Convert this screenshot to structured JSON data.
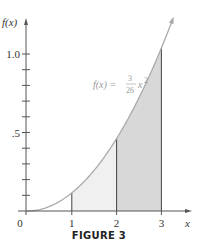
{
  "chart_data": {
    "type": "line",
    "title": "",
    "caption": "FIGURE 3",
    "function_label": {
      "prefix": "f(x) = ",
      "numerator": "3",
      "denominator": "26",
      "suffix": "x",
      "exponent": "2"
    },
    "xlabel": "x",
    "ylabel": "f(x)",
    "xlim": [
      0,
      3.6
    ],
    "ylim": [
      0,
      1.2
    ],
    "x_ticks": [
      "0",
      "1",
      "2",
      "3"
    ],
    "y_tick_labels": [
      {
        "value": 1.0,
        "label": "1.0"
      },
      {
        "value": 0.5,
        "label": ".5"
      }
    ],
    "y_minor_ticks": [
      0.1,
      0.2,
      0.3,
      0.4,
      0.5,
      0.6,
      0.7,
      0.8,
      0.9,
      1.0
    ],
    "series": [
      {
        "name": "f(x) = 3/26 x^2",
        "x": [
          0,
          0.5,
          1,
          1.5,
          2,
          2.5,
          3,
          3.2
        ],
        "y": [
          0,
          0.029,
          0.115,
          0.26,
          0.462,
          0.721,
          1.038,
          1.18
        ]
      }
    ],
    "shaded_regions": [
      {
        "from": 1,
        "to": 2,
        "color": "#f0f0f0"
      },
      {
        "from": 2,
        "to": 3,
        "color": "#d8d8d8"
      }
    ],
    "vertical_lines_at": [
      1,
      2,
      3
    ],
    "grid": false,
    "colors": {
      "curve": "#aaaaaa",
      "axis": "#555555"
    }
  }
}
